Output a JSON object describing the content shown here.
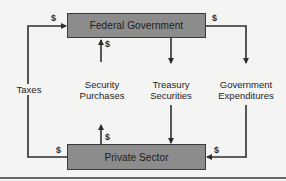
{
  "diagram": {
    "nodes": {
      "top": "Federal Government",
      "bottom": "Private Sector"
    },
    "flows": [
      {
        "label": "Taxes",
        "from": "Private Sector",
        "to": "Federal Government",
        "currency": "$"
      },
      {
        "label": "Security\nPurchases",
        "from": "Private Sector",
        "to": "Federal Government",
        "currency": "$"
      },
      {
        "label": "Treasury\nSecurities",
        "from": "Federal Government",
        "to": "Private Sector"
      },
      {
        "label": "Government\nExpenditures",
        "from": "Federal Government",
        "to": "Private Sector",
        "currency": "$"
      }
    ],
    "labels": {
      "taxes": "Taxes",
      "security_l1": "Security",
      "security_l2": "Purchases",
      "treasury_l1": "Treasury",
      "treasury_l2": "Securities",
      "govexp_l1": "Government",
      "govexp_l2": "Expenditures"
    },
    "currency_symbol": "$",
    "colors": {
      "box_fill": "#8c8c8c",
      "line": "#2e2e2e",
      "background": "#f4f4f2"
    }
  }
}
